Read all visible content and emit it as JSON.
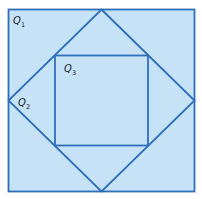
{
  "diagram": {
    "colors": {
      "fill": "#c5e2f7",
      "stroke": "#2f6fb8",
      "label": "#1a1a2e"
    },
    "labels": [
      {
        "id": "Q1",
        "base": "Q",
        "sub": "1"
      },
      {
        "id": "Q2",
        "base": "Q",
        "sub": "2"
      },
      {
        "id": "Q3",
        "base": "Q",
        "sub": "3"
      }
    ]
  }
}
